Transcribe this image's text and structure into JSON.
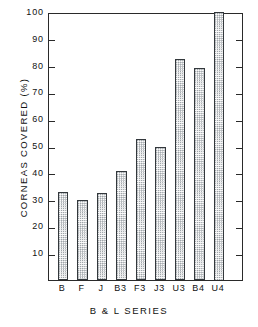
{
  "chart_data": {
    "type": "bar",
    "title": "",
    "xlabel": "B & L SERIES",
    "ylabel": "CORNEAS COVERED (%)",
    "categories": [
      "B",
      "F",
      "J",
      "B3",
      "F3",
      "J3",
      "U3",
      "B4",
      "U4"
    ],
    "values": [
      33,
      30,
      32.5,
      40.5,
      52.5,
      49.5,
      82.5,
      79,
      100
    ],
    "ylim": [
      0,
      100
    ],
    "xlim": [
      0,
      10
    ],
    "y_ticks": [
      10,
      20,
      30,
      40,
      50,
      60,
      70,
      80,
      90,
      100
    ],
    "y_tick_labels": [
      "10",
      "20",
      "30",
      "40",
      "50",
      "60",
      "70",
      "80",
      "90",
      "100"
    ],
    "grid": false,
    "legend": null,
    "bar_fill": "stippled",
    "colors": {
      "axis": "#2a2a2a",
      "bar_edge": "#33383c",
      "bar_fill": "#fbfbfb",
      "bar_stipple": "#9aa0a5",
      "text": "#111111",
      "background": "#ffffff"
    },
    "series": [
      {
        "name": "Corneas covered",
        "values": [
          33,
          30,
          32.5,
          40.5,
          52.5,
          49.5,
          82.5,
          79,
          100
        ]
      }
    ]
  }
}
